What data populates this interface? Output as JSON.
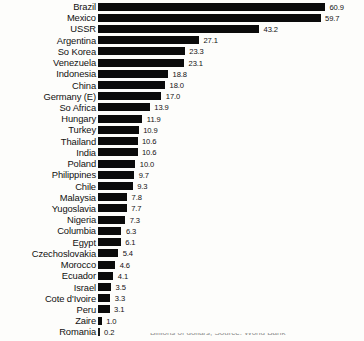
{
  "chart_data": {
    "type": "bar",
    "orientation": "horizontal",
    "title": "",
    "subtitle": "",
    "xlabel": "",
    "ylabel": "",
    "xlim": [
      0,
      60.9
    ],
    "grid": false,
    "legend": null,
    "value_label_format": "one-decimal",
    "bar_color": "#0b0b0b",
    "background_color": "#fdfdfb",
    "categories": [
      "Brazil",
      "Mexico",
      "USSR",
      "Argentina",
      "So Korea",
      "Venezuela",
      "Indonesia",
      "China",
      "Germany (E)",
      "So Africa",
      "Hungary",
      "Turkey",
      "Thailand",
      "India",
      "Poland",
      "Philippines",
      "Chile",
      "Malaysia",
      "Yugoslavia",
      "Nigeria",
      "Columbia",
      "Egypt",
      "Czechoslovakia",
      "Morocco",
      "Ecuador",
      "Israel",
      "Cote d'Ivoire",
      "Peru",
      "Zaire",
      "Romania"
    ],
    "values": [
      60.9,
      59.7,
      43.2,
      27.1,
      23.3,
      23.1,
      18.8,
      18.0,
      17.0,
      13.9,
      11.9,
      10.9,
      10.6,
      10.6,
      10.0,
      9.7,
      9.3,
      7.8,
      7.7,
      7.3,
      6.3,
      6.1,
      5.4,
      4.6,
      4.1,
      3.5,
      3.3,
      3.1,
      1.0,
      0.2
    ],
    "value_labels": [
      "60.9",
      "59.7",
      "43.2",
      "27.1",
      "23.3",
      "23.1",
      "18.8",
      "18.0",
      "17.0",
      "13.9",
      "11.9",
      "10.9",
      "10.6",
      "10.6",
      "10.0",
      "9.7",
      "9.3",
      "7.8",
      "7.7",
      "7.3",
      "6.3",
      "6.1",
      "5.4",
      "4.6",
      "4.1",
      "3.5",
      "3.3",
      "3.1",
      "1.0",
      "0.2"
    ]
  },
  "caption": {
    "clipped_text": "Billions of dollars, Source: World Bank"
  }
}
